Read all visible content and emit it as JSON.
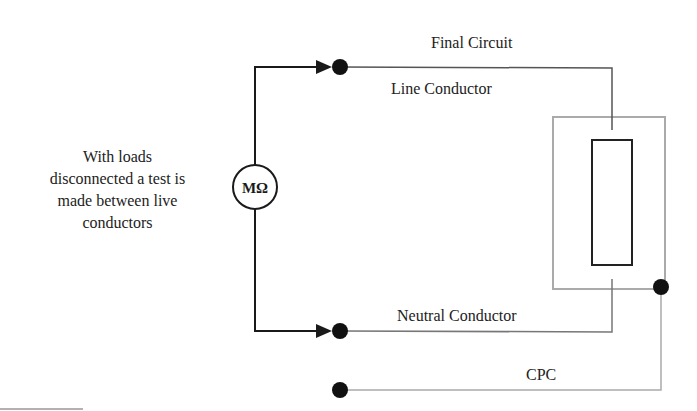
{
  "diagram": {
    "description_lines": [
      "With loads",
      "disconnected a test is",
      "made between live",
      "conductors"
    ],
    "meter": {
      "symbol": "MΩ",
      "icon": "megohmmeter-icon"
    },
    "labels": {
      "final_circuit": "Final Circuit",
      "line_conductor": "Line Conductor",
      "neutral_conductor": "Neutral Conductor",
      "cpc": "CPC"
    },
    "colors": {
      "test_leads": "#1a1a1a",
      "circuit_wiring": "#555555",
      "enclosure": "#aaaaaa",
      "load": "#222222",
      "terminal": "#111111"
    },
    "nodes": [
      {
        "id": "line-terminal",
        "label": "Line Conductor"
      },
      {
        "id": "neutral-terminal",
        "label": "Neutral Conductor"
      },
      {
        "id": "cpc-terminal",
        "label": "CPC"
      },
      {
        "id": "enclosure-earth-terminal",
        "label": "CPC"
      }
    ],
    "edges": [
      {
        "from": "meter",
        "to": "line-terminal",
        "style": "arrow"
      },
      {
        "from": "meter",
        "to": "neutral-terminal",
        "style": "arrow"
      },
      {
        "from": "line-terminal",
        "to": "load",
        "label": "Line Conductor"
      },
      {
        "from": "neutral-terminal",
        "to": "load",
        "label": "Neutral Conductor"
      },
      {
        "from": "cpc-terminal",
        "to": "enclosure-earth-terminal",
        "label": "CPC"
      }
    ]
  }
}
